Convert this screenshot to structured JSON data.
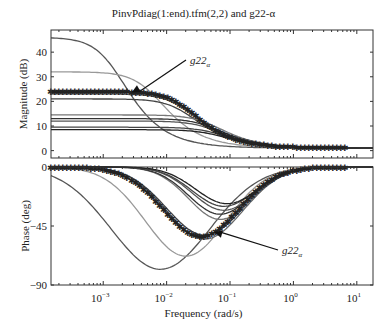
{
  "chart_data": {
    "type": "line",
    "title": "PinvPdiag(1:end).tfm(2,2) and g22-α",
    "xlabel": "Frequency (rad/s)",
    "xscale": "log",
    "xlim": [
      0.00015,
      18
    ],
    "xticks": [
      0.001,
      0.01,
      0.1,
      1,
      10
    ],
    "xtick_labels": [
      "10^-3",
      "10^-2",
      "10^-1",
      "10^0",
      "10^1"
    ],
    "grid": false,
    "panels": [
      {
        "name": "magnitude",
        "ylabel": "Magnitude (dB)",
        "ylim": [
          -3,
          49
        ],
        "yticks": [
          0,
          10,
          20,
          30,
          40
        ],
        "annotation": {
          "text": "g22α",
          "arrow_to": {
            "x": 0.003,
            "y": 24
          }
        },
        "series": [
          {
            "name": "plant-1",
            "dc_gain_db": 46,
            "hf_gain_db": 1,
            "corner": 0.0015,
            "color": "#555555"
          },
          {
            "name": "plant-2",
            "dc_gain_db": 32,
            "hf_gain_db": 1,
            "corner": 0.006,
            "color": "#999999"
          },
          {
            "name": "plant-3",
            "dc_gain_db": 23,
            "hf_gain_db": 1,
            "corner": 0.02,
            "color": "#666666"
          },
          {
            "name": "plant-4",
            "dc_gain_db": 21,
            "hf_gain_db": 1,
            "corner": 0.02,
            "color": "#444444"
          },
          {
            "name": "plant-5",
            "dc_gain_db": 14.5,
            "hf_gain_db": 1,
            "corner": 0.05,
            "color": "#777777"
          },
          {
            "name": "plant-6",
            "dc_gain_db": 13,
            "hf_gain_db": 1,
            "corner": 0.05,
            "color": "#333333"
          },
          {
            "name": "plant-7",
            "dc_gain_db": 12,
            "hf_gain_db": 1,
            "corner": 0.05,
            "color": "#555555"
          },
          {
            "name": "plant-8",
            "dc_gain_db": 9.5,
            "hf_gain_db": 1,
            "corner": 0.06,
            "color": "#444444"
          },
          {
            "name": "plant-9",
            "dc_gain_db": 8.5,
            "hf_gain_db": 1,
            "corner": 0.06,
            "color": "#222222"
          },
          {
            "name": "g22α",
            "dc_gain_db": 24,
            "hf_gain_db": 1,
            "corner": 0.02,
            "color": "#333333",
            "marker": "*"
          }
        ]
      },
      {
        "name": "phase",
        "ylabel": "Phase (deg)",
        "ylim": [
          -90,
          0
        ],
        "yticks": [
          -90,
          -45,
          0
        ],
        "annotation": {
          "text": "g22α",
          "arrow_to": {
            "x": 0.06,
            "y": -50
          }
        },
        "series": [
          {
            "name": "plant-1",
            "min_deg": -78,
            "min_freq": 0.008,
            "width": 1.1,
            "color": "#555555"
          },
          {
            "name": "plant-2",
            "min_deg": -68,
            "min_freq": 0.02,
            "width": 0.9,
            "color": "#999999"
          },
          {
            "name": "plant-3",
            "min_deg": -55,
            "min_freq": 0.04,
            "width": 0.85,
            "color": "#666666"
          },
          {
            "name": "plant-4",
            "min_deg": -52,
            "min_freq": 0.04,
            "width": 0.85,
            "color": "#444444"
          },
          {
            "name": "plant-5",
            "min_deg": -40,
            "min_freq": 0.07,
            "width": 0.7,
            "color": "#777777"
          },
          {
            "name": "plant-6",
            "min_deg": -36,
            "min_freq": 0.07,
            "width": 0.7,
            "color": "#333333"
          },
          {
            "name": "plant-7",
            "min_deg": -33,
            "min_freq": 0.08,
            "width": 0.7,
            "color": "#555555"
          },
          {
            "name": "plant-8",
            "min_deg": -30,
            "min_freq": 0.08,
            "width": 0.7,
            "color": "#444444"
          },
          {
            "name": "plant-9",
            "min_deg": -28,
            "min_freq": 0.09,
            "width": 0.7,
            "color": "#222222"
          },
          {
            "name": "g22α",
            "min_deg": -53,
            "min_freq": 0.035,
            "width": 0.85,
            "color": "#333333",
            "marker": "*"
          }
        ]
      }
    ]
  }
}
